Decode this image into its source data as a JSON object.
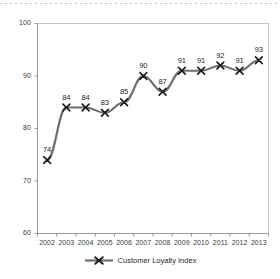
{
  "chart_data": {
    "type": "line",
    "title": "",
    "xlabel": "",
    "ylabel": "",
    "categories": [
      "2002",
      "2003",
      "2004",
      "2005",
      "2006",
      "2007",
      "2008",
      "2009",
      "2010",
      "2011",
      "2012",
      "2013"
    ],
    "series": [
      {
        "name": "Customer Loyalty Index",
        "values": [
          74,
          84,
          84,
          83,
          85,
          90,
          87,
          91,
          91,
          92,
          91,
          93
        ],
        "marker": "x-cross",
        "color": "#6e6e6e",
        "marker_color": "#1c1c1c"
      }
    ],
    "data_labels": [
      "74",
      "84",
      "84",
      "83",
      "85",
      "90",
      "87",
      "91",
      "91",
      "92",
      "91",
      "93"
    ],
    "ylim": [
      60,
      100
    ],
    "ytick_labels": [
      "100",
      "90",
      "80",
      "70",
      "60"
    ],
    "ytick_values": [
      100,
      90,
      80,
      70,
      60
    ],
    "xtick_labels": [
      "2002",
      "2003",
      "2004",
      "2005",
      "2006",
      "2007",
      "2008",
      "2009",
      "2010",
      "2011",
      "2012",
      "2013"
    ],
    "grid": false,
    "legend_position": "bottom",
    "legend_entries": [
      "Customer Loyalty Index"
    ],
    "plot_border_color": "#c4c4c4",
    "axis_color": "#9a9a9a",
    "background": "#ffffff"
  },
  "decorations": {
    "top_rule_name": "top-dotted-rule"
  }
}
